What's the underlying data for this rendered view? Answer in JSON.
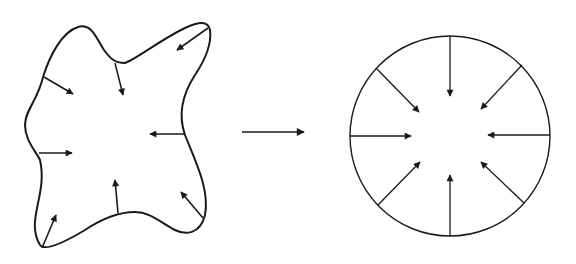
{
  "figure": {
    "description": "Irregular closed shape with inward-pointing normal arrows transforms into a circle with evenly spaced inward-pointing radial arrows",
    "left_shape": {
      "type": "irregular-blob",
      "arrow_count": 8,
      "arrow_direction": "inward"
    },
    "transform_arrow": {
      "direction": "right"
    },
    "right_shape": {
      "type": "circle",
      "arrow_count": 8,
      "arrow_direction": "inward",
      "arrow_spacing_deg": 45
    },
    "colors": {
      "stroke": "#1a1a1a",
      "background": "#ffffff"
    }
  }
}
